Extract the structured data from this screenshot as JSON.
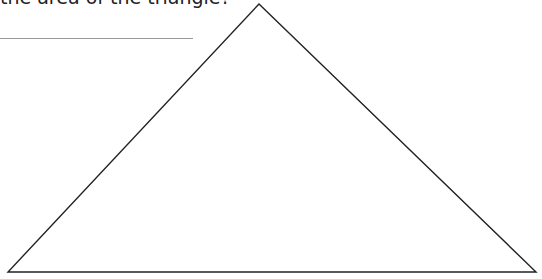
{
  "question": {
    "text": "the area of the triangle?"
  },
  "answer_line": {
    "color": "#9a9a9a"
  },
  "triangle": {
    "stroke": "#222222",
    "vertices": {
      "apex": [
        259,
        4
      ],
      "bottom_left": [
        8,
        272
      ],
      "bottom_right": [
        536,
        272
      ]
    }
  }
}
